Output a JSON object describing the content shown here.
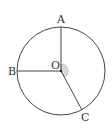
{
  "diagram": {
    "type": "circle-geometry",
    "center": {
      "label": "O",
      "x": 61,
      "y": 71
    },
    "radius": 44,
    "points": [
      {
        "label": "A",
        "x": 61,
        "y": 27,
        "label_x": 57,
        "label_y": 23
      },
      {
        "label": "B",
        "x": 17,
        "y": 71,
        "label_x": 8,
        "label_y": 75
      },
      {
        "label": "C",
        "x": 82,
        "y": 110,
        "label_x": 81,
        "label_y": 121
      }
    ],
    "segments": [
      "OA",
      "OB",
      "OC"
    ],
    "angle_marker": {
      "between": [
        "OA",
        "OC"
      ],
      "shaded": true,
      "color": "#d9d9d9"
    },
    "colors": {
      "stroke": "#444444",
      "text": "#333333"
    }
  }
}
